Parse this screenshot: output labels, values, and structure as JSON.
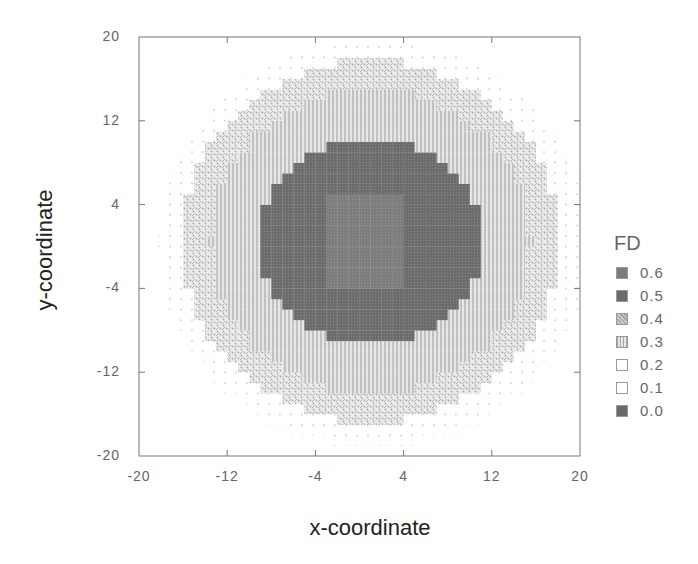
{
  "chart_data": {
    "type": "heatmap",
    "title": "",
    "xlabel": "x-coordinate",
    "ylabel": "y-coordinate",
    "xlim": [
      -20,
      20
    ],
    "ylim": [
      -20,
      20
    ],
    "xticks": [
      "-20",
      "-12",
      "-4",
      "4",
      "12",
      "20"
    ],
    "yticks": [
      "20",
      "12",
      "4",
      "-4",
      "-12",
      "-20"
    ],
    "grid": false,
    "legend": {
      "title": "FD",
      "position": "right",
      "entries": [
        {
          "label": "0.6",
          "value": 0.6,
          "color": "#7a7a7a",
          "pattern": "solid-light"
        },
        {
          "label": "0.5",
          "value": 0.5,
          "color": "#6a6a6a",
          "pattern": "solid"
        },
        {
          "label": "0.4",
          "value": 0.4,
          "color": "#b0b0b0",
          "pattern": "crosshatch"
        },
        {
          "label": "0.3",
          "value": 0.3,
          "color": "#c4c4c4",
          "pattern": "vertical-lines"
        },
        {
          "label": "0.2",
          "value": 0.2,
          "color": "#d8d8d8",
          "pattern": "sparse-dots"
        },
        {
          "label": "0.1",
          "value": 0.1,
          "color": "#ffffff",
          "pattern": "empty"
        },
        {
          "label": "0.0",
          "value": 0.0,
          "color": "#6e6e6e",
          "pattern": "solid"
        }
      ]
    },
    "field_description": "Radially decreasing FD field centered near (0,0): core value 0.6 in |x|<=3,|y|<=4; 0.5 disk to radius ~10; 0.3 ring to radius ~14.5; 0.4 ring to radius ~17; 0.2 dots to radius ~19; 0.1 elsewhere",
    "regions": [
      {
        "value": 0.6,
        "shape": "square",
        "x_range": [
          -3,
          4
        ],
        "y_range": [
          -4,
          5
        ]
      },
      {
        "value": 0.5,
        "shape": "disk",
        "center": [
          1,
          0.5
        ],
        "radius": 10
      },
      {
        "value": 0.3,
        "shape": "disk",
        "center": [
          1,
          0.5
        ],
        "radius": 14.5
      },
      {
        "value": 0.4,
        "shape": "disk",
        "center": [
          1,
          0.5
        ],
        "radius": 17.2
      },
      {
        "value": 0.2,
        "shape": "disk",
        "center": [
          1,
          0.5
        ],
        "radius": 19.5
      },
      {
        "value": 0.1,
        "shape": "background"
      }
    ]
  }
}
